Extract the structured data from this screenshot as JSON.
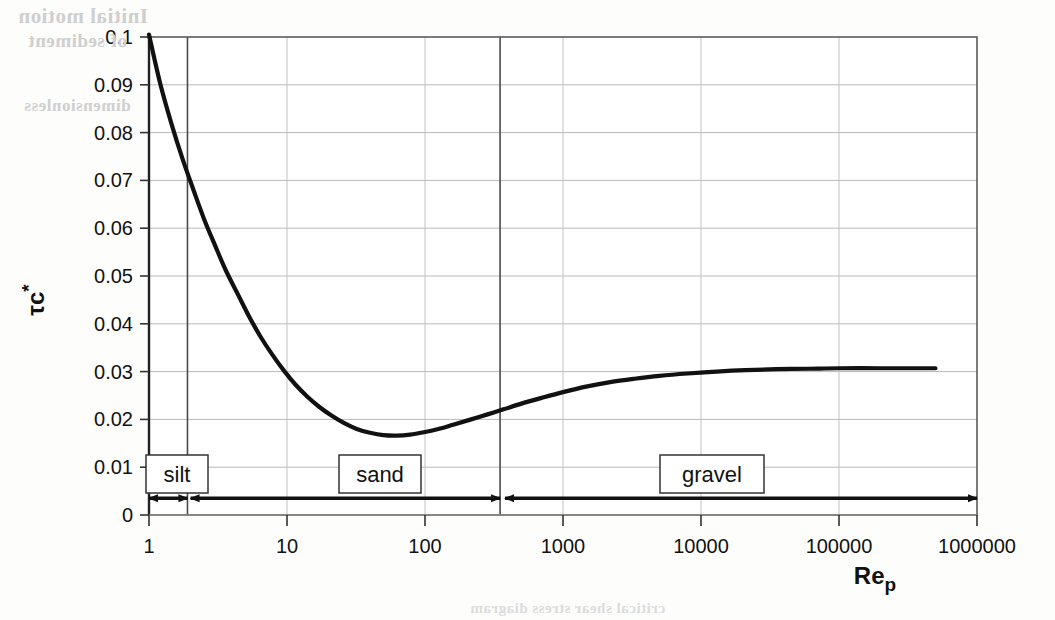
{
  "figure": {
    "ghost_text": {
      "line1": "Initial motion",
      "line2": "of sediment",
      "line3": "dimensionless",
      "line4": "critical shear stress diagram"
    }
  },
  "chart_data": {
    "type": "line",
    "title": "",
    "xlabel": "Reₚ",
    "xlabel_base": "Re",
    "xlabel_sub": "p",
    "ylabel": "τc*",
    "ylabel_base": "τc",
    "ylabel_sup": "*",
    "xscale": "log",
    "yscale": "linear",
    "xlim": [
      1,
      1000000
    ],
    "ylim": [
      0,
      0.1
    ],
    "grid": true,
    "legend": "none",
    "xticks": [
      1,
      10,
      100,
      1000,
      10000,
      100000,
      1000000
    ],
    "xtick_labels": [
      "1",
      "10",
      "100",
      "1000",
      "10000",
      "100000",
      "1000000"
    ],
    "yticks": [
      0,
      0.01,
      0.02,
      0.03,
      0.04,
      0.05,
      0.06,
      0.07,
      0.08,
      0.09,
      0.1
    ],
    "ytick_labels": [
      "0",
      "0.01",
      "0.02",
      "0.03",
      "0.04",
      "0.05",
      "0.06",
      "0.07",
      "0.08",
      "0.09",
      "0.1"
    ],
    "series": [
      {
        "name": "Shields critical shear stress curve",
        "color": "#111111",
        "points": [
          [
            1.0,
            0.1005
          ],
          [
            1.2,
            0.0905
          ],
          [
            1.45,
            0.082
          ],
          [
            1.75,
            0.0745
          ],
          [
            2.1,
            0.068
          ],
          [
            2.5,
            0.062
          ],
          [
            3.0,
            0.0565
          ],
          [
            3.6,
            0.0512
          ],
          [
            4.4,
            0.0462
          ],
          [
            5.3,
            0.0416
          ],
          [
            6.4,
            0.0374
          ],
          [
            7.8,
            0.0336
          ],
          [
            9.5,
            0.0302
          ],
          [
            11.5,
            0.0273
          ],
          [
            14.0,
            0.0248
          ],
          [
            17.0,
            0.0227
          ],
          [
            21.0,
            0.0208
          ],
          [
            26.0,
            0.0192
          ],
          [
            32.0,
            0.018
          ],
          [
            40.0,
            0.0172
          ],
          [
            50.0,
            0.0167
          ],
          [
            62.0,
            0.0166
          ],
          [
            78.0,
            0.0168
          ],
          [
            98.0,
            0.0173
          ],
          [
            125.0,
            0.018
          ],
          [
            160.0,
            0.0189
          ],
          [
            210.0,
            0.0199
          ],
          [
            280.0,
            0.021
          ],
          [
            370.0,
            0.0221
          ],
          [
            500.0,
            0.0233
          ],
          [
            700.0,
            0.0245
          ],
          [
            1000.0,
            0.0257
          ],
          [
            1500.0,
            0.0269
          ],
          [
            2200.0,
            0.0278
          ],
          [
            3300.0,
            0.0285
          ],
          [
            5000.0,
            0.0291
          ],
          [
            8000.0,
            0.0296
          ],
          [
            13000.0,
            0.03
          ],
          [
            21000.0,
            0.0303
          ],
          [
            35000.0,
            0.0305
          ],
          [
            60000.0,
            0.0306
          ],
          [
            100000.0,
            0.0307
          ],
          [
            200000.0,
            0.0307
          ],
          [
            350000.0,
            0.0307
          ],
          [
            500000.0,
            0.0307
          ]
        ]
      }
    ],
    "regions": [
      {
        "label": "silt",
        "x_start": 1,
        "x_end": 1.9,
        "divider_at": 1.9
      },
      {
        "label": "sand",
        "x_start": 2.0,
        "x_end": 350,
        "divider_at": 350
      },
      {
        "label": "gravel",
        "x_start": 380,
        "x_end": 1000000,
        "divider_at": null
      }
    ],
    "annotation_arrow_y": 0.0035
  }
}
